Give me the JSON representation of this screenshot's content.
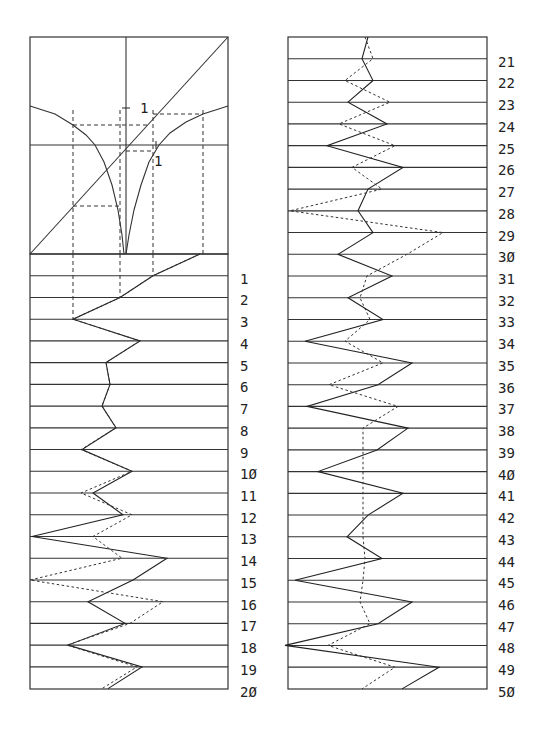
{
  "figure": {
    "map_panel": {
      "tick_label_y": "1",
      "tick_label_x": "1"
    },
    "left_panel": {
      "row_labels": [
        "1",
        "2",
        "3",
        "4",
        "5",
        "6",
        "7",
        "8",
        "9",
        "1Ø",
        "11",
        "12",
        "13",
        "14",
        "15",
        "16",
        "17",
        "18",
        "19",
        "2Ø"
      ]
    },
    "right_panel": {
      "row_labels": [
        "21",
        "22",
        "23",
        "24",
        "25",
        "26",
        "27",
        "28",
        "29",
        "3Ø",
        "31",
        "32",
        "33",
        "34",
        "35",
        "36",
        "37",
        "38",
        "39",
        "4Ø",
        "41",
        "42",
        "43",
        "44",
        "45",
        "46",
        "47",
        "48",
        "49",
        "5Ø"
      ]
    }
  },
  "chart_data": [
    {
      "type": "line",
      "title": "Map function with cobweb construction",
      "xlabel": "",
      "ylabel": "",
      "annotations": [
        "1 (tick on vertical axis)",
        "1 (tick on horizontal axis)"
      ],
      "series": [
        {
          "name": "identity y=x",
          "style": "solid",
          "points_px": [
            [
              30,
              254
            ],
            [
              228,
              37
            ]
          ]
        },
        {
          "name": "map branch left",
          "style": "solid",
          "points_px": [
            [
              30,
              106
            ],
            [
              55,
              114
            ],
            [
              73,
              125
            ],
            [
              86,
              135
            ],
            [
              95,
              145
            ],
            [
              104,
              162
            ],
            [
              112,
              185
            ],
            [
              118,
              210
            ],
            [
              122,
              235
            ],
            [
              124,
              254
            ]
          ]
        },
        {
          "name": "map branch right",
          "style": "solid",
          "points_px": [
            [
              126,
              254
            ],
            [
              129,
              235
            ],
            [
              134,
              210
            ],
            [
              141,
              185
            ],
            [
              149,
              162
            ],
            [
              159,
              145
            ],
            [
              170,
              133
            ],
            [
              186,
              122
            ],
            [
              203,
              114
            ],
            [
              228,
              106
            ]
          ]
        },
        {
          "name": "cobweb guides",
          "style": "dashed",
          "verticals_x": [
            73,
            120,
            153,
            203
          ],
          "horizontals": [
            [
              73,
              206,
              120
            ],
            [
              126,
              151,
              153
            ],
            [
              73,
              125,
              149
            ],
            [
              153,
              114,
              203
            ]
          ]
        }
      ]
    },
    {
      "type": "line",
      "title": "Trajectories, iterations 1-20",
      "x_range_px": [
        30,
        228
      ],
      "iterations": [
        0,
        1,
        2,
        3,
        4,
        5,
        6,
        7,
        8,
        9,
        10,
        11,
        12,
        13,
        14,
        15,
        16,
        17,
        18,
        19,
        20
      ],
      "series": [
        {
          "name": "trajectory A",
          "style": "solid",
          "x_px": [
            200,
            153,
            120,
            73,
            140,
            106,
            110,
            102,
            116,
            82,
            132,
            93,
            123,
            32,
            167,
            133,
            88,
            125,
            68,
            142,
            108
          ]
        },
        {
          "name": "trajectory B",
          "style": "dotted",
          "x_px": [
            200,
            153,
            120,
            73,
            140,
            106,
            110,
            102,
            116,
            81,
            132,
            81,
            132,
            93,
            122,
            30,
            163,
            130,
            67,
            137,
            102
          ]
        }
      ],
      "guide_dashed_x_px": [
        73,
        120,
        153
      ],
      "guide_rows": 3
    },
    {
      "type": "line",
      "title": "Trajectories, iterations 21-50",
      "x_range_px": [
        288,
        487
      ],
      "iterations": [
        20,
        21,
        22,
        23,
        24,
        25,
        26,
        27,
        28,
        29,
        30,
        31,
        32,
        33,
        34,
        35,
        36,
        37,
        38,
        39,
        40,
        41,
        42,
        43,
        44,
        45,
        46,
        47,
        48,
        49,
        50
      ],
      "series": [
        {
          "name": "trajectory A",
          "style": "solid",
          "x_px": [
            368,
            362,
            373,
            348,
            387,
            327,
            403,
            368,
            358,
            373,
            338,
            392,
            348,
            383,
            305,
            412,
            378,
            307,
            408,
            377,
            318,
            403,
            368,
            347,
            382,
            295,
            412,
            378,
            285,
            439,
            402
          ]
        },
        {
          "name": "trajectory B",
          "style": "dotted",
          "x_px": [
            365,
            373,
            345,
            390,
            339,
            395,
            352,
            382,
            290,
            443,
            407,
            367,
            360,
            370,
            345,
            383,
            329,
            398,
            363,
            363,
            363,
            363,
            363,
            363,
            365,
            363,
            360,
            370,
            328,
            395,
            362
          ]
        }
      ]
    }
  ]
}
